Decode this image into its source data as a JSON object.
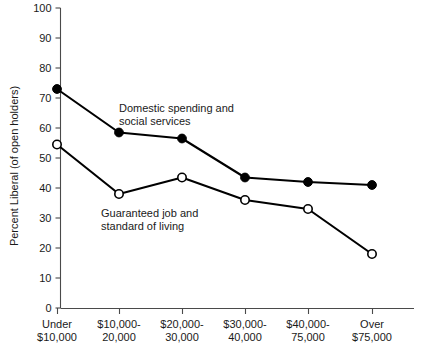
{
  "chart_data": {
    "type": "line",
    "title": "",
    "xlabel": "",
    "ylabel": "Percent Liberal (of open holders)",
    "ylim": [
      0,
      100
    ],
    "ytick_step": 10,
    "grid": false,
    "legend_position": "inline-annotation",
    "categories": [
      "Under\n$10,000",
      "$10,000-\n20,000",
      "$20,000-\n30,000",
      "$30,000-\n40,000",
      "$40,000-\n75,000",
      "Over\n$75,000"
    ],
    "category_lines": [
      [
        "Under",
        "$10,000"
      ],
      [
        "$10,000-",
        "20,000"
      ],
      [
        "$20,000-",
        "30,000"
      ],
      [
        "$30,000-",
        "40,000"
      ],
      [
        "$40,000-",
        "75,000"
      ],
      [
        "Over",
        "$75,000"
      ]
    ],
    "ytick_labels": [
      "0",
      "10",
      "20",
      "30",
      "40",
      "50",
      "60",
      "70",
      "80",
      "90",
      "100"
    ],
    "ytick_values": [
      0,
      10,
      20,
      30,
      40,
      50,
      60,
      70,
      80,
      90,
      100
    ],
    "series": [
      {
        "name": "Domestic spending and social services",
        "marker": "filled-circle",
        "color": "#000000",
        "values": [
          73,
          58.5,
          56.5,
          43.5,
          42,
          41
        ]
      },
      {
        "name": "Guaranteed job and standard of living",
        "marker": "open-circle",
        "color": "#000000",
        "values": [
          54.5,
          38,
          43.5,
          36,
          33,
          18
        ]
      }
    ],
    "annotations": [
      {
        "id": "annotation-domestic-spending",
        "lines": [
          "Domestic spending and",
          "social services"
        ],
        "x": 119,
        "y": 112
      },
      {
        "id": "annotation-guaranteed-job",
        "lines": [
          "Guaranteed job and",
          "standard of living"
        ],
        "x": 101,
        "y": 217
      }
    ]
  },
  "axes": {
    "y_axis_title": "Percent Liberal (of open holders)",
    "accent_color": "#000000",
    "axis_color": "#4a4a4a"
  }
}
